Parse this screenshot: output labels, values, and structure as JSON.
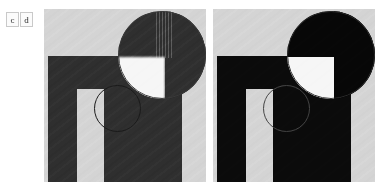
{
  "figure": {
    "background_color": "#ffffff",
    "panel_background_color": "#d4d4d4",
    "object_color_c": "#2f2f2f",
    "object_color_d": "#0b0b0b",
    "void_color": "#f6f6f6"
  },
  "panels": [
    {
      "label": "c",
      "name": "panel-c",
      "phantom_shape": "n-arch",
      "inset_shape": "circle",
      "inset_content": "magnified-corner",
      "roi_marker": "circle-outline"
    },
    {
      "label": "d",
      "name": "panel-d",
      "phantom_shape": "n-arch",
      "inset_shape": "circle",
      "inset_content": "magnified-corner",
      "roi_marker": "circle-outline"
    }
  ]
}
